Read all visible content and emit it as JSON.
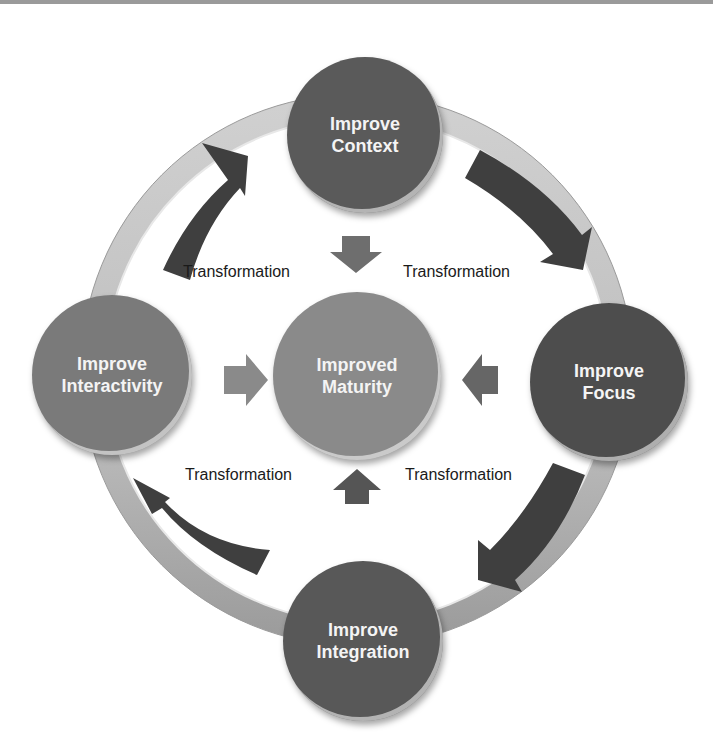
{
  "diagram": {
    "type": "cycle",
    "center": {
      "label_line1": "Improved",
      "label_line2": "Maturity",
      "color": "#8a8a8a"
    },
    "nodes": [
      {
        "id": "context",
        "label_line1": "Improve",
        "label_line2": "Context",
        "color": "#5a5a5a"
      },
      {
        "id": "focus",
        "label_line1": "Improve",
        "label_line2": "Focus",
        "color": "#4d4d4d"
      },
      {
        "id": "integration",
        "label_line1": "Improve",
        "label_line2": "Integration",
        "color": "#585858"
      },
      {
        "id": "interactivity",
        "label_line1": "Improve",
        "label_line2": "Interactivity",
        "color": "#7a7a7a"
      }
    ],
    "transitions": [
      {
        "label": "Transformation"
      },
      {
        "label": "Transformation"
      },
      {
        "label": "Transformation"
      },
      {
        "label": "Transformation"
      }
    ],
    "colors": {
      "ring": "#c4c4c4",
      "ring_lower": "#a8a8a8",
      "arrow": "#3f3f3f",
      "inner_arrow": "#6e6e6e"
    }
  }
}
